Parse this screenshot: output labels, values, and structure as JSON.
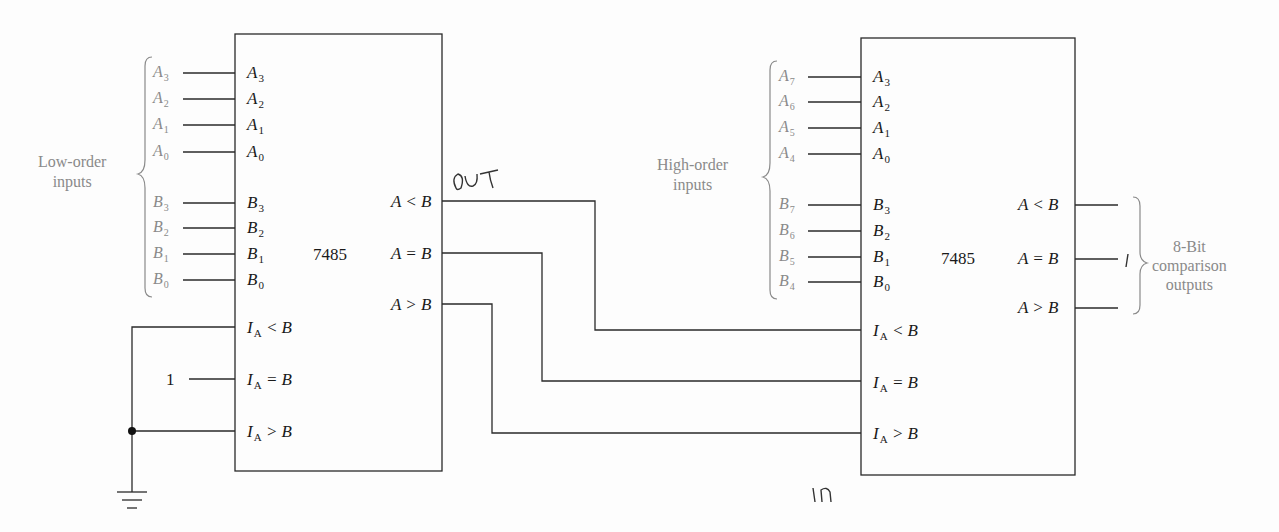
{
  "diagram": {
    "chips": [
      {
        "id": "low",
        "part": "7485",
        "group_label": "Low-order inputs",
        "inputs_a": [
          {
            "ext": "A",
            "ext_sub": "3",
            "pin": "A",
            "pin_sub": "3"
          },
          {
            "ext": "A",
            "ext_sub": "2",
            "pin": "A",
            "pin_sub": "2"
          },
          {
            "ext": "A",
            "ext_sub": "1",
            "pin": "A",
            "pin_sub": "1"
          },
          {
            "ext": "A",
            "ext_sub": "0",
            "pin": "A",
            "pin_sub": "0"
          }
        ],
        "inputs_b": [
          {
            "ext": "B",
            "ext_sub": "3",
            "pin": "B",
            "pin_sub": "3"
          },
          {
            "ext": "B",
            "ext_sub": "2",
            "pin": "B",
            "pin_sub": "2"
          },
          {
            "ext": "B",
            "ext_sub": "1",
            "pin": "B",
            "pin_sub": "1"
          },
          {
            "ext": "B",
            "ext_sub": "0",
            "pin": "B",
            "pin_sub": "0"
          }
        ],
        "cascade_inputs": [
          {
            "pre": "I",
            "sub": "A",
            "post": " < B",
            "tie": "ground"
          },
          {
            "pre": "I",
            "sub": "A",
            "post": " = B",
            "tie": "1"
          },
          {
            "pre": "I",
            "sub": "A",
            "post": " > B",
            "tie": "ground"
          }
        ],
        "outputs": [
          "A < B",
          "A = B",
          "A > B"
        ]
      },
      {
        "id": "high",
        "part": "7485",
        "group_label": "High-order inputs",
        "inputs_a": [
          {
            "ext": "A",
            "ext_sub": "7",
            "pin": "A",
            "pin_sub": "3"
          },
          {
            "ext": "A",
            "ext_sub": "6",
            "pin": "A",
            "pin_sub": "2"
          },
          {
            "ext": "A",
            "ext_sub": "5",
            "pin": "A",
            "pin_sub": "1"
          },
          {
            "ext": "A",
            "ext_sub": "4",
            "pin": "A",
            "pin_sub": "0"
          }
        ],
        "inputs_b": [
          {
            "ext": "B",
            "ext_sub": "7",
            "pin": "B",
            "pin_sub": "3"
          },
          {
            "ext": "B",
            "ext_sub": "6",
            "pin": "B",
            "pin_sub": "2"
          },
          {
            "ext": "B",
            "ext_sub": "5",
            "pin": "B",
            "pin_sub": "1"
          },
          {
            "ext": "B",
            "ext_sub": "4",
            "pin": "B",
            "pin_sub": "0"
          }
        ],
        "cascade_inputs": [
          {
            "pre": "I",
            "sub": "A",
            "post": " < B"
          },
          {
            "pre": "I",
            "sub": "A",
            "post": " = B"
          },
          {
            "pre": "I",
            "sub": "A",
            "post": " > B"
          }
        ],
        "outputs": [
          "A < B",
          "A = B",
          "A > B"
        ],
        "output_group_label": [
          "8-Bit",
          "comparison",
          "outputs"
        ]
      }
    ],
    "tie_high_value": "1",
    "annotations": {
      "out": "OUT",
      "in": "IN",
      "mark": "I"
    },
    "colors": {
      "line": "#2a2a2a",
      "label_gray": "#8a8a8a",
      "text": "#1a1a1a"
    }
  }
}
